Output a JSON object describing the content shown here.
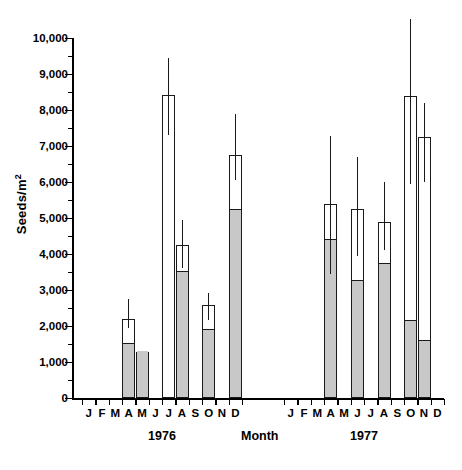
{
  "axes": {
    "ylabel_text": "Seeds/m",
    "ylabel_sup": "2",
    "xlabel_text": "Month",
    "ytick_labels": [
      "0",
      "1,000",
      "2,000",
      "3,000",
      "4,000",
      "5,000",
      "6,000",
      "7,000",
      "8,000",
      "9,000",
      "10,000"
    ]
  },
  "panels": [
    {
      "year_label": "1976"
    },
    {
      "year_label": "1977"
    }
  ],
  "chart_data": {
    "type": "bar",
    "title": "",
    "xlabel": "Month",
    "ylabel": "Seeds/m2",
    "ylim": [
      0,
      10000
    ],
    "ytick_step": 1000,
    "yminor_step": 500,
    "grid": false,
    "legend_position": "none",
    "stacked": true,
    "series": [
      {
        "name": "lower (shaded) component",
        "fill": "#c8c8c8"
      },
      {
        "name": "upper (open) component",
        "fill": "#ffffff"
      }
    ],
    "panel_years": [
      "1976",
      "1977"
    ],
    "categories": [
      "1976-J",
      "1976-F",
      "1976-M",
      "1976-A",
      "1976-M",
      "1976-J",
      "1976-J",
      "1976-A",
      "1976-S",
      "1976-O",
      "1976-N",
      "1976-D",
      "1977-J",
      "1977-F",
      "1977-M",
      "1977-A",
      "1977-M",
      "1977-J",
      "1977-J",
      "1977-A",
      "1977-S",
      "1977-O",
      "1977-N",
      "1977-D"
    ],
    "tick_labels": [
      "J",
      "F",
      "M",
      "A",
      "M",
      "J",
      "J",
      "A",
      "S",
      "O",
      "N",
      "D"
    ],
    "bars": [
      {
        "panel": 0,
        "month": "A",
        "month_index": 3,
        "total": 2200,
        "shaded": 1500,
        "open": 700,
        "err_low": 1950,
        "err_high": 2750
      },
      {
        "panel": 0,
        "month": "M",
        "month_index": 4,
        "total": 1270,
        "shaded": 1270,
        "open": 0,
        "err_low": null,
        "err_high": null
      },
      {
        "panel": 0,
        "month": "J",
        "month_index": 6,
        "total": 8420,
        "shaded": 0,
        "open": 8420,
        "err_low": 7300,
        "err_high": 9450
      },
      {
        "panel": 0,
        "month": "J",
        "month_index": 7,
        "total": 4250,
        "shaded": 3500,
        "open": 750,
        "err_low": 3600,
        "err_high": 4950
      },
      {
        "panel": 0,
        "month": "S",
        "month_index": 9,
        "total": 2580,
        "shaded": 1880,
        "open": 700,
        "err_low": 2180,
        "err_high": 2930
      },
      {
        "panel": 0,
        "month": "N",
        "month_index": 11,
        "total": 6750,
        "shaded": 5230,
        "open": 1520,
        "err_low": 6050,
        "err_high": 7880
      },
      {
        "panel": 1,
        "month": "M",
        "month_index": 3,
        "total": 5390,
        "shaded": 4400,
        "open": 990,
        "err_low": 3450,
        "err_high": 7280
      },
      {
        "panel": 1,
        "month": "M",
        "month_index": 5,
        "total": 5240,
        "shaded": 3250,
        "open": 1990,
        "err_low": 3950,
        "err_high": 6700
      },
      {
        "panel": 1,
        "month": "J",
        "month_index": 7,
        "total": 4900,
        "shaded": 3720,
        "open": 1180,
        "err_low": 4100,
        "err_high": 6000
      },
      {
        "panel": 1,
        "month": "S",
        "month_index": 9,
        "total": 8400,
        "shaded": 2150,
        "open": 6250,
        "err_low": 5950,
        "err_high": 10530
      },
      {
        "panel": 1,
        "month": "O",
        "month_index": 10,
        "total": 7250,
        "shaded": 1580,
        "open": 5670,
        "err_low": 6000,
        "err_high": 8200
      }
    ]
  }
}
